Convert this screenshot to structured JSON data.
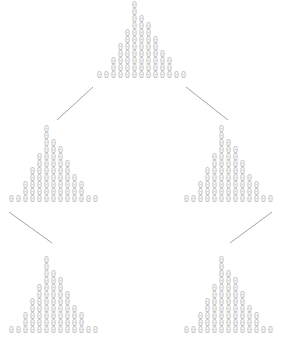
{
  "figure": {
    "type": "histogram-tree",
    "background_color": "#ffffff",
    "glyph": "0",
    "glyph_color": "#c2c2c2",
    "edge_color": "#9a9a9a",
    "width": 282,
    "height": 337
  },
  "chart_data": {
    "type": "bar",
    "title": "",
    "subtitle": "",
    "xlabel": "",
    "ylabel": "",
    "grid": false,
    "legend": "none",
    "glyph_mark": "0",
    "categories": [
      "1",
      "2",
      "3",
      "4",
      "5",
      "6",
      "7",
      "8",
      "9",
      "10",
      "11",
      "12",
      "13"
    ],
    "ylim": [
      0,
      12
    ],
    "nodes": [
      {
        "id": "root",
        "name": "root-histogram",
        "x": 96,
        "y": 2,
        "anchor_x": 100,
        "anchor_y": 80,
        "values": [
          1,
          1,
          3,
          5,
          7,
          11,
          9,
          8,
          6,
          4,
          3,
          1,
          1
        ]
      },
      {
        "id": "left",
        "name": "left-child-histogram",
        "x": 8,
        "y": 126,
        "anchor_x": 12,
        "anchor_y": 204,
        "values": [
          1,
          1,
          3,
          5,
          7,
          11,
          9,
          8,
          6,
          4,
          3,
          1,
          1
        ]
      },
      {
        "id": "right",
        "name": "right-child-histogram",
        "x": 183,
        "y": 126,
        "anchor_x": 187,
        "anchor_y": 204,
        "values": [
          1,
          1,
          3,
          5,
          7,
          11,
          9,
          8,
          6,
          4,
          3,
          1,
          1
        ]
      },
      {
        "id": "left-leaf",
        "name": "left-leaf-histogram",
        "x": 8,
        "y": 257,
        "anchor_x": 12,
        "anchor_y": 335,
        "values": [
          1,
          1,
          3,
          5,
          7,
          11,
          9,
          8,
          6,
          4,
          3,
          1,
          1
        ]
      },
      {
        "id": "right-leaf",
        "name": "right-leaf-histogram",
        "x": 183,
        "y": 257,
        "anchor_x": 187,
        "anchor_y": 335,
        "values": [
          1,
          1,
          3,
          5,
          7,
          11,
          9,
          8,
          6,
          4,
          3,
          1,
          1
        ]
      }
    ],
    "edges": [
      {
        "name": "edge-root-to-left",
        "x1": 93,
        "y1": 87,
        "x2": 57,
        "y2": 120
      },
      {
        "name": "edge-root-to-right",
        "x1": 186,
        "y1": 87,
        "x2": 228,
        "y2": 120
      },
      {
        "name": "edge-left-to-leaf",
        "x1": 9,
        "y1": 212,
        "x2": 52,
        "y2": 243
      },
      {
        "name": "edge-right-to-leaf",
        "x1": 272,
        "y1": 212,
        "x2": 230,
        "y2": 243
      }
    ]
  }
}
